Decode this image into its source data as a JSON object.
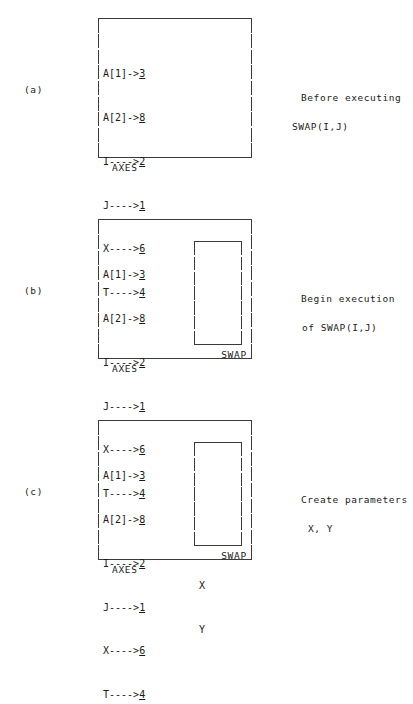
{
  "figure": {
    "type": "ascii-stack-diagram",
    "frame_outer_label": "AXES",
    "frame_inner_label": "SWAP",
    "bindings": [
      {
        "name": "A[1]",
        "arrow": "->",
        "value": "3"
      },
      {
        "name": "A[2]",
        "arrow": "->",
        "value": "8"
      },
      {
        "name": "I",
        "arrow": "---->",
        "value": "2"
      },
      {
        "name": "J",
        "arrow": "---->",
        "value": "1"
      },
      {
        "name": "X",
        "arrow": "---->",
        "value": "6"
      },
      {
        "name": "T",
        "arrow": "---->",
        "value": "4"
      }
    ]
  },
  "panels": [
    {
      "label": "(a)",
      "outer_frame_label": "AXES",
      "has_inner_frame": false,
      "inner_frame_label": "",
      "inner_slots": [
        "",
        "",
        "",
        "",
        "",
        ""
      ],
      "annotation_line_1": "Before executing",
      "annotation_line_2": "SWAP(I,J)"
    },
    {
      "label": "(b)",
      "outer_frame_label": "AXES",
      "has_inner_frame": true,
      "inner_frame_label": "SWAP",
      "inner_slots": [
        "",
        "",
        "",
        "",
        "",
        ""
      ],
      "annotation_line_1": "Begin execution",
      "annotation_line_2": "of SWAP(I,J)"
    },
    {
      "label": "(c)",
      "outer_frame_label": "AXES",
      "has_inner_frame": true,
      "inner_frame_label": "SWAP",
      "inner_slots": [
        "",
        "",
        "X",
        "Y",
        "",
        ""
      ],
      "annotation_line_1": "Create parameters",
      "annotation_line_2": "X, Y"
    }
  ],
  "style": {
    "ink_color": "#1a1a1a",
    "rule_color": "#3a3a3a",
    "background": "#ffffff"
  }
}
